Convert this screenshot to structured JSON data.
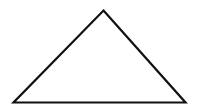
{
  "diagram": {
    "shape": "triangle",
    "background": "#ffffff",
    "stroke_color": "#111111",
    "fill_color": "#ffffff",
    "stroke_width": 2.2,
    "vertices": {
      "apex": [
        103.5,
        10.5
      ],
      "bottom_left": [
        13.5,
        102.5
      ],
      "bottom_right": [
        185.5,
        102.5
      ]
    }
  }
}
